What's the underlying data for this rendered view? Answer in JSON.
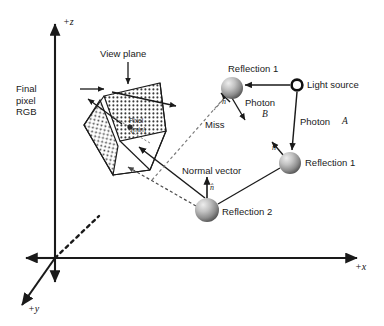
{
  "figure": {
    "type": "diagram",
    "background": "#ffffff",
    "ink": "#1a1a1a"
  },
  "axes": {
    "z_label": "+z",
    "x_label": "+x",
    "y_label": "+y",
    "origin": {
      "x": 55,
      "y": 258
    }
  },
  "view_plane": {
    "label": "View plane",
    "final_pixel_label": "Final\npixel\nRGB",
    "pixel_label": "Pixel",
    "pixel_sub_label": "(min)"
  },
  "light": {
    "label": "Light source",
    "photon_a_label": "Photon",
    "photon_a_name": "A",
    "photon_b_label": "Photon",
    "photon_b_name": "B"
  },
  "rays": {
    "miss_label": "Miss",
    "normal_vector_label": "Normal vector",
    "normal_symbol": "n̂"
  },
  "surfaces": [
    {
      "id": "refl1-top",
      "label": "Reflection 1",
      "cx": 232,
      "cy": 88,
      "r": 11
    },
    {
      "id": "refl1-right",
      "label": "Reflection 1",
      "cx": 290,
      "cy": 163,
      "r": 11
    },
    {
      "id": "refl2",
      "label": "Reflection 2",
      "cx": 207,
      "cy": 210,
      "r": 12
    }
  ],
  "labels": {
    "reflection_1_top": "Reflection 1",
    "reflection_1_right": "Reflection 1",
    "reflection_2": "Reflection 2"
  },
  "colors": {
    "line": "#1a1a1a",
    "sphere_light": "#d8d8d8",
    "sphere_mid": "#9a9a9a",
    "sphere_dark": "#5e5e5e",
    "dash": "#6f6f6f"
  }
}
